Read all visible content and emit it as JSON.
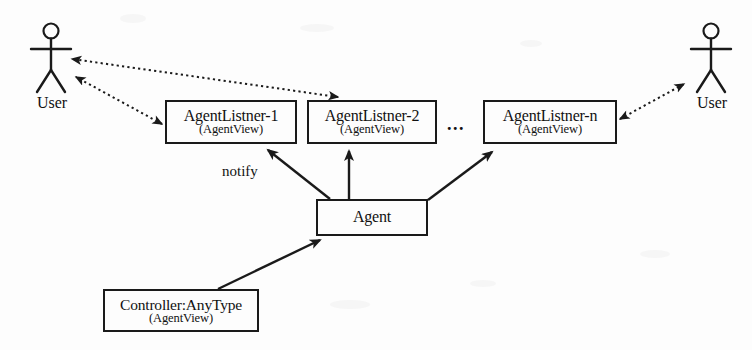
{
  "diagram": {
    "type": "uml-object-diagram",
    "background_color": "#fdfdfd",
    "stroke_color": "#1a1a1a"
  },
  "actors": [
    {
      "id": "user-left",
      "label": "User",
      "icon": "stick-figure-actor-icon",
      "x": 28,
      "y": 20
    },
    {
      "id": "user-right",
      "label": "User",
      "icon": "stick-figure-actor-icon",
      "x": 688,
      "y": 20
    }
  ],
  "nodes": [
    {
      "id": "agent-listner-1",
      "title": "AgentListner-1",
      "subtitle": "(AgentView)",
      "x": 165,
      "y": 100,
      "w": 132,
      "h": 44
    },
    {
      "id": "agent-listner-2",
      "title": "AgentListner-2",
      "subtitle": "(AgentView)",
      "x": 307,
      "y": 100,
      "w": 130,
      "h": 44
    },
    {
      "id": "agent-listner-n",
      "title": "AgentListner-n",
      "subtitle": "(AgentView)",
      "x": 483,
      "y": 100,
      "w": 134,
      "h": 44
    },
    {
      "id": "agent",
      "title": "Agent",
      "subtitle": "",
      "x": 316,
      "y": 199,
      "w": 112,
      "h": 37
    },
    {
      "id": "controller",
      "title": "Controller:AnyType",
      "subtitle": "(AgentView)",
      "x": 103,
      "y": 289,
      "w": 156,
      "h": 43
    }
  ],
  "ellipsis": {
    "text": "...",
    "x": 447,
    "y": 114
  },
  "edge_labels": [
    {
      "id": "notify-label",
      "text": "notify",
      "x": 222,
      "y": 163
    }
  ],
  "edges": [
    {
      "id": "edge-listner2-to-user-left",
      "style": "dotted",
      "arrows": "both",
      "from": "agent-listner-2",
      "to": "user-left"
    },
    {
      "id": "edge-listner1-to-user-left",
      "style": "dotted",
      "arrows": "both",
      "from": "agent-listner-1",
      "to": "user-left"
    },
    {
      "id": "edge-listnern-to-user-right",
      "style": "dotted",
      "arrows": "both",
      "from": "agent-listner-n",
      "to": "user-right"
    },
    {
      "id": "edge-agent-to-listner1",
      "style": "solid",
      "arrows": "single",
      "from": "agent",
      "to": "agent-listner-1",
      "label": "notify"
    },
    {
      "id": "edge-agent-to-listner2",
      "style": "solid",
      "arrows": "single",
      "from": "agent",
      "to": "agent-listner-2"
    },
    {
      "id": "edge-agent-to-listnern",
      "style": "solid",
      "arrows": "single",
      "from": "agent",
      "to": "agent-listner-n"
    },
    {
      "id": "edge-controller-to-agent",
      "style": "solid",
      "arrows": "single",
      "from": "controller",
      "to": "agent"
    }
  ]
}
